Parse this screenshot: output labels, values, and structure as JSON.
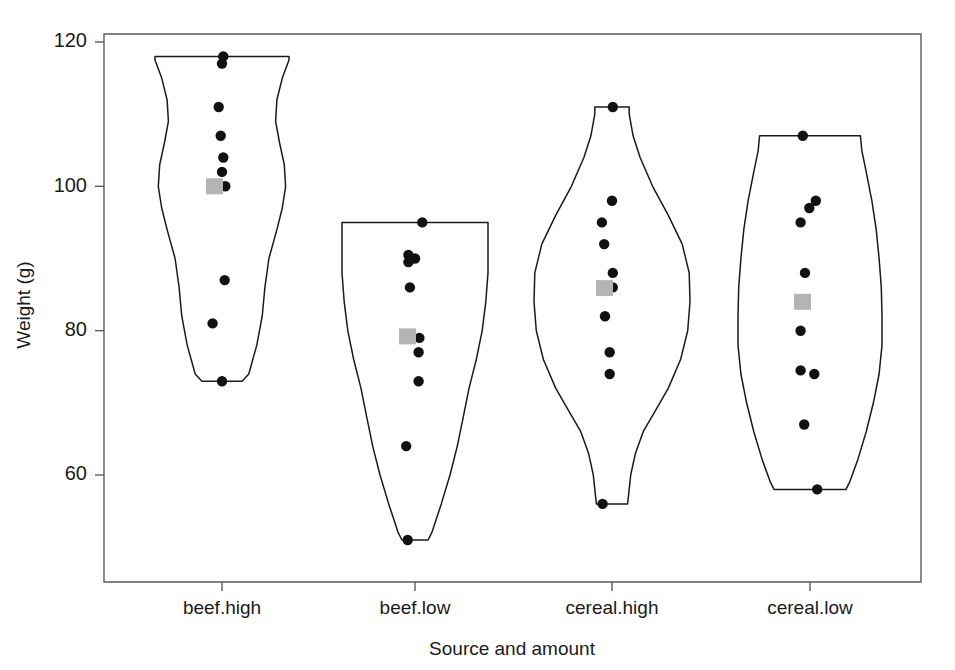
{
  "chart_data": {
    "type": "violin",
    "title": "",
    "xlabel": "Source and amount",
    "ylabel": "Weight (g)",
    "categories": [
      "beef.high",
      "beef.low",
      "cereal.high",
      "cereal.low"
    ],
    "ylim": [
      46,
      124
    ],
    "yticks": [
      60,
      80,
      100,
      120
    ],
    "ytick_labels": [
      "60",
      "80",
      "100",
      "120"
    ],
    "grid": false,
    "legend": "none",
    "marker_colors": {
      "point": "#111111",
      "mean_square": "#b4b4b4",
      "outline": "#1a1a1a",
      "frame": "#5a5a5a"
    },
    "annotations": [
      "Grey square marks the group mean",
      "Black dots are individual observations",
      "Outline is the kernel density (violin) shape"
    ],
    "groups": [
      {
        "name": "beef.high",
        "mean": 100.0,
        "min": 73,
        "max": 118,
        "points": [
          {
            "value": 118,
            "jitter": 0.02
          },
          {
            "value": 117,
            "jitter": 0.0
          },
          {
            "value": 111,
            "jitter": -0.05
          },
          {
            "value": 107,
            "jitter": -0.02
          },
          {
            "value": 104,
            "jitter": 0.02
          },
          {
            "value": 102,
            "jitter": 0.0
          },
          {
            "value": 100,
            "jitter": 0.05
          },
          {
            "value": 87,
            "jitter": 0.04
          },
          {
            "value": 81,
            "jitter": -0.14
          },
          {
            "value": 73,
            "jitter": 0.0
          }
        ],
        "density": [
          {
            "y": 73,
            "w": 0.3
          },
          {
            "y": 74,
            "w": 0.4
          },
          {
            "y": 78,
            "w": 0.52
          },
          {
            "y": 82,
            "w": 0.6
          },
          {
            "y": 86,
            "w": 0.64
          },
          {
            "y": 90,
            "w": 0.7
          },
          {
            "y": 94,
            "w": 0.82
          },
          {
            "y": 97,
            "w": 0.9
          },
          {
            "y": 100,
            "w": 0.95
          },
          {
            "y": 103,
            "w": 0.93
          },
          {
            "y": 106,
            "w": 0.86
          },
          {
            "y": 109,
            "w": 0.8
          },
          {
            "y": 112,
            "w": 0.82
          },
          {
            "y": 115,
            "w": 0.9
          },
          {
            "y": 117.5,
            "w": 1.0
          },
          {
            "y": 118,
            "w": 1.0
          }
        ]
      },
      {
        "name": "beef.low",
        "mean": 79.2,
        "min": 51,
        "max": 95,
        "points": [
          {
            "value": 95,
            "jitter": 0.1
          },
          {
            "value": 90.5,
            "jitter": -0.09
          },
          {
            "value": 90,
            "jitter": 0.0
          },
          {
            "value": 89.5,
            "jitter": -0.09
          },
          {
            "value": 86,
            "jitter": -0.07
          },
          {
            "value": 79,
            "jitter": 0.06
          },
          {
            "value": 77,
            "jitter": 0.05
          },
          {
            "value": 73,
            "jitter": 0.05
          },
          {
            "value": 64,
            "jitter": -0.12
          },
          {
            "value": 51,
            "jitter": -0.1
          }
        ],
        "density": [
          {
            "y": 51,
            "w": 0.18
          },
          {
            "y": 52,
            "w": 0.23
          },
          {
            "y": 56,
            "w": 0.36
          },
          {
            "y": 60,
            "w": 0.48
          },
          {
            "y": 64,
            "w": 0.58
          },
          {
            "y": 68,
            "w": 0.66
          },
          {
            "y": 72,
            "w": 0.74
          },
          {
            "y": 76,
            "w": 0.84
          },
          {
            "y": 80,
            "w": 0.92
          },
          {
            "y": 84,
            "w": 0.97
          },
          {
            "y": 88,
            "w": 1.0
          },
          {
            "y": 91,
            "w": 1.0
          },
          {
            "y": 93.5,
            "w": 1.0
          },
          {
            "y": 95,
            "w": 1.0
          }
        ]
      },
      {
        "name": "cereal.high",
        "mean": 85.9,
        "min": 56,
        "max": 111,
        "points": [
          {
            "value": 111,
            "jitter": 0.01
          },
          {
            "value": 98,
            "jitter": 0.0
          },
          {
            "value": 95,
            "jitter": -0.13
          },
          {
            "value": 92,
            "jitter": -0.1
          },
          {
            "value": 88,
            "jitter": 0.01
          },
          {
            "value": 86,
            "jitter": 0.01
          },
          {
            "value": 82,
            "jitter": -0.09
          },
          {
            "value": 77,
            "jitter": -0.03
          },
          {
            "value": 74,
            "jitter": -0.03
          },
          {
            "value": 56,
            "jitter": -0.12
          }
        ],
        "density": [
          {
            "y": 56,
            "w": 0.2
          },
          {
            "y": 57,
            "w": 0.21
          },
          {
            "y": 60,
            "w": 0.24
          },
          {
            "y": 63,
            "w": 0.3
          },
          {
            "y": 66,
            "w": 0.4
          },
          {
            "y": 69,
            "w": 0.56
          },
          {
            "y": 72,
            "w": 0.72
          },
          {
            "y": 76,
            "w": 0.88
          },
          {
            "y": 80,
            "w": 0.97
          },
          {
            "y": 84,
            "w": 1.0
          },
          {
            "y": 88,
            "w": 0.99
          },
          {
            "y": 92,
            "w": 0.9
          },
          {
            "y": 96,
            "w": 0.72
          },
          {
            "y": 100,
            "w": 0.52
          },
          {
            "y": 104,
            "w": 0.36
          },
          {
            "y": 107,
            "w": 0.27
          },
          {
            "y": 110,
            "w": 0.22
          },
          {
            "y": 111,
            "w": 0.22
          }
        ]
      },
      {
        "name": "cereal.low",
        "mean": 84.0,
        "min": 58,
        "max": 107,
        "points": [
          {
            "value": 107,
            "jitter": -0.1
          },
          {
            "value": 98,
            "jitter": 0.08
          },
          {
            "value": 97,
            "jitter": -0.01
          },
          {
            "value": 95,
            "jitter": -0.13
          },
          {
            "value": 88,
            "jitter": -0.07
          },
          {
            "value": 80,
            "jitter": -0.13
          },
          {
            "value": 74.5,
            "jitter": -0.13
          },
          {
            "value": 74,
            "jitter": 0.06
          },
          {
            "value": 67,
            "jitter": -0.08
          },
          {
            "value": 58,
            "jitter": 0.1
          }
        ],
        "density": [
          {
            "y": 58,
            "w": 0.5
          },
          {
            "y": 59,
            "w": 0.55
          },
          {
            "y": 62,
            "w": 0.66
          },
          {
            "y": 66,
            "w": 0.78
          },
          {
            "y": 70,
            "w": 0.88
          },
          {
            "y": 74,
            "w": 0.96
          },
          {
            "y": 78,
            "w": 1.0
          },
          {
            "y": 82,
            "w": 1.0
          },
          {
            "y": 86,
            "w": 0.99
          },
          {
            "y": 90,
            "w": 0.96
          },
          {
            "y": 94,
            "w": 0.92
          },
          {
            "y": 98,
            "w": 0.86
          },
          {
            "y": 102,
            "w": 0.78
          },
          {
            "y": 105,
            "w": 0.72
          },
          {
            "y": 107,
            "w": 0.7
          }
        ]
      }
    ]
  }
}
